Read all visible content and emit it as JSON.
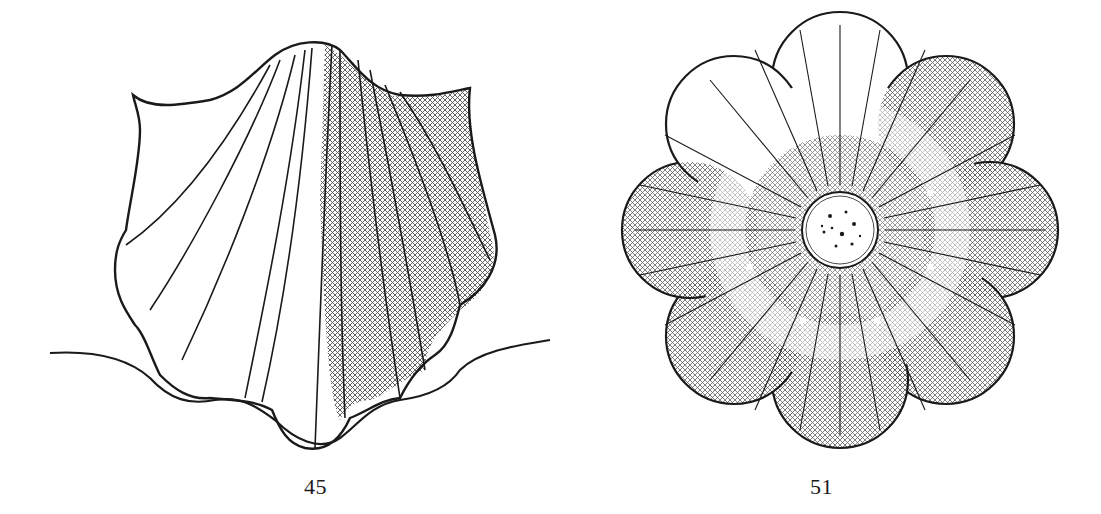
{
  "plate": {
    "style": "engraved line illustration, black ink on white",
    "ink_color": "#1a1a1a",
    "paper_color": "#ffffff"
  },
  "figures": [
    {
      "number": "45",
      "subject": "scallop-shell ornament with radiating flutes and cross-hatched shading on right side",
      "caption": "45"
    },
    {
      "number": "51",
      "subject": "eight-petalled rosette with radiating lines, cross-hatched petal tips and stippled central boss",
      "caption": "51",
      "petal_count": 8
    }
  ]
}
